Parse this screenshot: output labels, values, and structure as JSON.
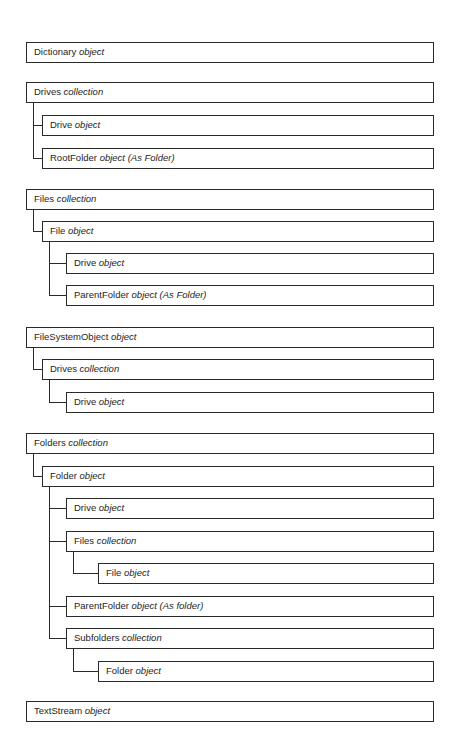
{
  "diagram": {
    "title": "",
    "nodes": [
      {
        "id": "dictionary",
        "name": "Dictionary",
        "kind": "object",
        "level": 0,
        "top": 42
      },
      {
        "id": "drives-col",
        "name": "Drives",
        "kind": "collection",
        "level": 0,
        "top": 82
      },
      {
        "id": "drives-drive",
        "name": "Drive",
        "kind": "object",
        "level": 1,
        "top": 115,
        "parent": "drives-col"
      },
      {
        "id": "drives-rootfolder",
        "name": "RootFolder",
        "kind": "object (As Folder)",
        "level": 1,
        "top": 148,
        "parent": "drives-col"
      },
      {
        "id": "files-col",
        "name": "Files",
        "kind": "collection",
        "level": 0,
        "top": 189
      },
      {
        "id": "files-file",
        "name": "File",
        "kind": "object",
        "level": 1,
        "top": 221,
        "parent": "files-col"
      },
      {
        "id": "files-file-drive",
        "name": "Drive",
        "kind": "object",
        "level": 2,
        "top": 253,
        "parent": "files-file"
      },
      {
        "id": "files-file-parentfolder",
        "name": "ParentFolder",
        "kind": "object (As Folder)",
        "level": 2,
        "top": 285,
        "parent": "files-file"
      },
      {
        "id": "fso",
        "name": "FileSystemObject",
        "kind": "object",
        "level": 0,
        "top": 327
      },
      {
        "id": "fso-drives",
        "name": "Drives",
        "kind": "collection",
        "level": 1,
        "top": 359,
        "parent": "fso"
      },
      {
        "id": "fso-drives-drive",
        "name": "Drive",
        "kind": "object",
        "level": 2,
        "top": 392,
        "parent": "fso-drives"
      },
      {
        "id": "folders-col",
        "name": "Folders",
        "kind": "collection",
        "level": 0,
        "top": 433
      },
      {
        "id": "folders-folder",
        "name": "Folder",
        "kind": "object",
        "level": 1,
        "top": 466,
        "parent": "folders-col"
      },
      {
        "id": "folders-folder-drive",
        "name": "Drive",
        "kind": "object",
        "level": 2,
        "top": 498,
        "parent": "folders-folder"
      },
      {
        "id": "folders-folder-files",
        "name": "Files",
        "kind": "collection",
        "level": 2,
        "top": 531,
        "parent": "folders-folder"
      },
      {
        "id": "folders-folder-files-file",
        "name": "File",
        "kind": "object",
        "level": 3,
        "top": 563,
        "parent": "folders-folder-files"
      },
      {
        "id": "folders-folder-parentfolder",
        "name": "ParentFolder",
        "kind": "object (As folder)",
        "level": 2,
        "top": 596,
        "parent": "folders-folder"
      },
      {
        "id": "folders-folder-subfolders",
        "name": "Subfolders",
        "kind": "collection",
        "level": 2,
        "top": 628,
        "parent": "folders-folder"
      },
      {
        "id": "folders-folder-subfolders-folder",
        "name": "Folder",
        "kind": "object",
        "level": 3,
        "top": 661,
        "parent": "folders-folder-subfolders"
      },
      {
        "id": "textstream",
        "name": "TextStream",
        "kind": "object",
        "level": 0,
        "top": 701
      }
    ],
    "layout": {
      "level_left": [
        26,
        42,
        66,
        98
      ],
      "right": 434,
      "box_height": 21,
      "stroke_color": "#2a2a2a"
    }
  }
}
